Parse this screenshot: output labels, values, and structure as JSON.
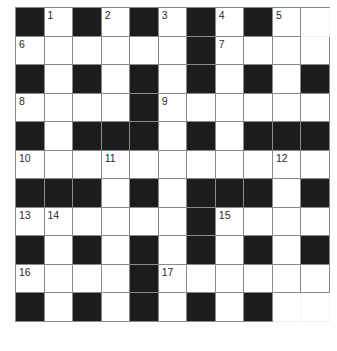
{
  "puzzle": {
    "rows": 11,
    "cols": 11,
    "colors": {
      "black_cell": "#1c1c1c",
      "white_cell": "#ffffff",
      "grid_line": "#8a8a8a"
    },
    "grid": [
      [
        "#",
        "1",
        "#",
        "2",
        "#",
        "3",
        "#",
        "4",
        "#",
        "5",
        "."
      ],
      [
        "6",
        ".",
        ".",
        ".",
        ".",
        ".",
        "#",
        "7",
        ".",
        ".",
        "."
      ],
      [
        "#",
        ".",
        "#",
        ".",
        "#",
        ".",
        "#",
        ".",
        "#",
        ".",
        "#"
      ],
      [
        "8",
        ".",
        ".",
        ".",
        "#",
        "9",
        ".",
        ".",
        ".",
        ".",
        "."
      ],
      [
        "#",
        ".",
        "#",
        "#",
        "#",
        ".",
        "#",
        ".",
        "#",
        "#",
        "#"
      ],
      [
        "10",
        ".",
        ".",
        "11",
        ".",
        ".",
        ".",
        ".",
        ".",
        "12",
        "."
      ],
      [
        "#",
        "#",
        "#",
        ".",
        "#",
        ".",
        "#",
        "#",
        "#",
        ".",
        "#"
      ],
      [
        "13",
        "14",
        ".",
        ".",
        ".",
        ".",
        "#",
        "15",
        ".",
        ".",
        "."
      ],
      [
        "#",
        ".",
        "#",
        ".",
        "#",
        ".",
        "#",
        ".",
        "#",
        ".",
        "#"
      ],
      [
        "16",
        ".",
        ".",
        ".",
        "#",
        "17",
        ".",
        ".",
        ".",
        ".",
        "."
      ],
      [
        "#",
        ".",
        "#",
        ".",
        "#",
        ".",
        "#",
        ".",
        "#",
        ".",
        "."
      ]
    ],
    "faded_cells": [
      [
        0,
        10
      ],
      [
        10,
        9
      ],
      [
        10,
        10
      ]
    ],
    "clue_numbers": [
      {
        "number": "1",
        "row": 0,
        "col": 1
      },
      {
        "number": "2",
        "row": 0,
        "col": 3
      },
      {
        "number": "3",
        "row": 0,
        "col": 5
      },
      {
        "number": "4",
        "row": 0,
        "col": 7
      },
      {
        "number": "5",
        "row": 0,
        "col": 9
      },
      {
        "number": "6",
        "row": 1,
        "col": 0
      },
      {
        "number": "7",
        "row": 1,
        "col": 7
      },
      {
        "number": "8",
        "row": 3,
        "col": 0
      },
      {
        "number": "9",
        "row": 3,
        "col": 5
      },
      {
        "number": "10",
        "row": 5,
        "col": 0
      },
      {
        "number": "11",
        "row": 5,
        "col": 3
      },
      {
        "number": "12",
        "row": 5,
        "col": 9
      },
      {
        "number": "13",
        "row": 7,
        "col": 0
      },
      {
        "number": "14",
        "row": 7,
        "col": 1
      },
      {
        "number": "15",
        "row": 7,
        "col": 7
      },
      {
        "number": "16",
        "row": 9,
        "col": 0
      },
      {
        "number": "17",
        "row": 9,
        "col": 5
      }
    ]
  }
}
